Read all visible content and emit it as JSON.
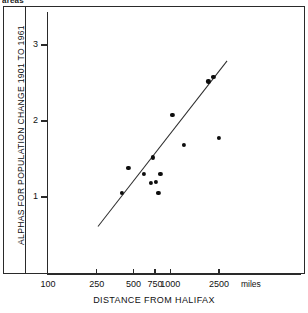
{
  "caption_fragment": "areas",
  "chart_data": {
    "type": "scatter",
    "title": "",
    "xlabel": "DISTANCE FROM HALIFAX",
    "ylabel": "ALPHAS FOR POPULATION CHANGE 1901 TO 1961",
    "x_unit": "miles",
    "x_scale": "log",
    "y_scale": "linear",
    "grid": false,
    "legend": false,
    "xlim": [
      100,
      3000
    ],
    "ylim": [
      0.45,
      3.25
    ],
    "xticks": [
      100,
      250,
      500,
      750,
      1000,
      2500
    ],
    "xtick_labels": [
      "100",
      "250",
      "500",
      "750",
      "1000",
      "2500"
    ],
    "yticks": [
      1,
      2,
      3
    ],
    "ytick_labels": [
      "1",
      "2",
      "3"
    ],
    "points": [
      {
        "x": 400,
        "y": 1.05
      },
      {
        "x": 455,
        "y": 1.38
      },
      {
        "x": 610,
        "y": 1.3
      },
      {
        "x": 690,
        "y": 1.19
      },
      {
        "x": 720,
        "y": 1.52
      },
      {
        "x": 760,
        "y": 1.2
      },
      {
        "x": 800,
        "y": 1.05
      },
      {
        "x": 830,
        "y": 1.3
      },
      {
        "x": 1040,
        "y": 2.08
      },
      {
        "x": 1300,
        "y": 1.69
      },
      {
        "x": 2050,
        "y": 2.52
      },
      {
        "x": 2250,
        "y": 2.58
      },
      {
        "x": 2500,
        "y": 1.78
      }
    ],
    "fit_line": {
      "type": "linear-on-log-x",
      "x_start": 255,
      "y_start": 0.62,
      "x_end": 2900,
      "y_end": 2.8
    }
  }
}
